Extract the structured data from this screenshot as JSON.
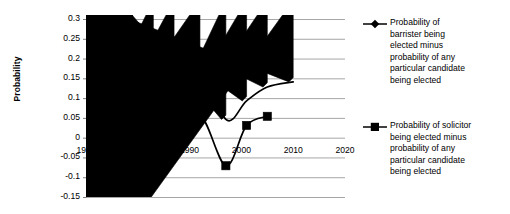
{
  "chart_data": {
    "type": "line",
    "title": "",
    "subtitle": "",
    "xlabel": "",
    "ylabel": "Probability",
    "xlim": [
      1970,
      2020
    ],
    "ylim": [
      -0.15,
      0.3
    ],
    "grid": true,
    "grid_orientation": "horizontal",
    "legend_position": "right",
    "x_ticks": [
      "1970",
      "1980",
      "1990",
      "2000",
      "2010",
      "2020"
    ],
    "x_tick_values": [
      1970,
      1980,
      1990,
      2000,
      2010,
      2020
    ],
    "y_ticks": [
      "0.3",
      "0.25",
      "0.2",
      "0.15",
      "0.1",
      "0.05",
      "0",
      "-0.05",
      "-0.1",
      "-0.15"
    ],
    "y_tick_values": [
      0.3,
      0.25,
      0.2,
      0.15,
      0.1,
      0.05,
      0,
      -0.05,
      -0.1,
      -0.15
    ],
    "series": [
      {
        "name": "Probability of barrister being elected minus probability of any particular candidate being elected",
        "name_lines": [
          "Probability of",
          "barrister being",
          "elected minus",
          "probability of any",
          "particular candidate",
          "being elected"
        ],
        "marker": "diamond",
        "color": "#000000",
        "x": [
          1974,
          1974.6,
          1979,
          1983,
          1987,
          1992,
          1997,
          2001,
          2005,
          2010
        ],
        "values": [
          0.263,
          0.236,
          0.196,
          0.152,
          0.145,
          0.194,
          0.046,
          0.093,
          0.128,
          0.141
        ]
      },
      {
        "name": "Probability of solicitor being elected minus probability of any particular candidate being elected",
        "name_lines": [
          "Probability of solicitor",
          "being elected minus",
          "probability of any",
          "particular candidate",
          "being elected"
        ],
        "marker": "square",
        "color": "#000000",
        "x": [
          1974,
          1979,
          1983,
          1987,
          1992,
          1997,
          2001,
          2005
        ],
        "values": [
          -0.114,
          -0.084,
          0.025,
          -0.018,
          0.056,
          -0.071,
          0.031,
          0.054
        ]
      }
    ]
  },
  "legend": {
    "entries": [
      {
        "marker": "diamond-marker-icon",
        "lines": [
          "Probability of",
          "barrister being",
          "elected minus",
          "probability of any",
          "particular candidate",
          "being elected"
        ]
      },
      {
        "marker": "square-marker-icon",
        "lines": [
          "Probability of solicitor",
          "being elected minus",
          "probability of any",
          "particular candidate",
          "being elected"
        ]
      }
    ]
  },
  "colors": {
    "series": "#000000",
    "gridline": "#a6a6a6",
    "axis": "#808080",
    "background": "#ffffff"
  }
}
